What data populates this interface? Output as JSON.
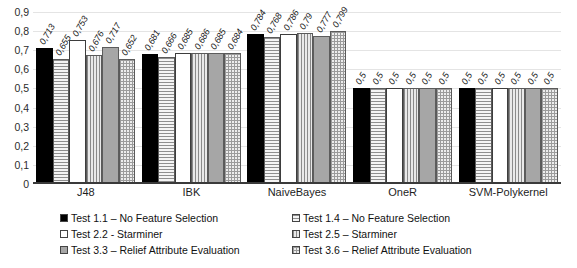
{
  "chart_data": {
    "type": "bar",
    "title": "",
    "xlabel": "",
    "ylabel": "",
    "ylim": [
      0,
      0.9
    ],
    "grid": true,
    "legend_position": "bottom",
    "categories": [
      "J48",
      "IBK",
      "NaiveBayes",
      "OneR",
      "SVM-Polykernel"
    ],
    "ytick_labels": [
      "0,9",
      "0,8",
      "0,7",
      "0,6",
      "0,5",
      "0,4",
      "0,3",
      "0,2",
      "0,1",
      "0"
    ],
    "ytick_values": [
      0.9,
      0.8,
      0.7,
      0.6,
      0.5,
      0.4,
      0.3,
      0.2,
      0.1,
      0
    ],
    "series": [
      {
        "name": "Test 1.1 – No Feature Selection",
        "pattern": "solid-black",
        "values": [
          0.713,
          0.681,
          0.784,
          0.5,
          0.5
        ],
        "labels": [
          "0,713",
          "0,681",
          "0,784",
          "0,5",
          "0,5"
        ]
      },
      {
        "name": "Test 1.4 – No Feature Selection",
        "pattern": "hlines",
        "values": [
          0.655,
          0.666,
          0.768,
          0.5,
          0.5
        ],
        "labels": [
          "0,655",
          "0,666",
          "0,768",
          "0,5",
          "0,5"
        ]
      },
      {
        "name": "Test 2.2 - Starminer",
        "pattern": "white",
        "values": [
          0.753,
          0.685,
          0.786,
          0.5,
          0.5
        ],
        "labels": [
          "0,753",
          "0,685",
          "0,786",
          "0,5",
          "0,5"
        ]
      },
      {
        "name": "Test 2.5 – Starminer",
        "pattern": "vlines",
        "values": [
          0.676,
          0.686,
          0.79,
          0.5,
          0.5
        ],
        "labels": [
          "0,676",
          "0,686",
          "0,79",
          "0,5",
          "0,5"
        ]
      },
      {
        "name": "Test 3.3 – Relief Attribute Evaluation",
        "pattern": "solid-gray",
        "values": [
          0.717,
          0.685,
          0.777,
          0.5,
          0.5
        ],
        "labels": [
          "0,717",
          "0,685",
          "0,777",
          "0,5",
          "0,5"
        ]
      },
      {
        "name": "Test 3.6 – Relief Attribute Evaluation",
        "pattern": "checker",
        "values": [
          0.652,
          0.684,
          0.799,
          0.5,
          0.5
        ],
        "labels": [
          "0,652",
          "0,684",
          "0,799",
          "0,5",
          "0,5"
        ]
      }
    ],
    "legend_order": [
      0,
      1,
      2,
      3,
      4,
      5
    ]
  }
}
